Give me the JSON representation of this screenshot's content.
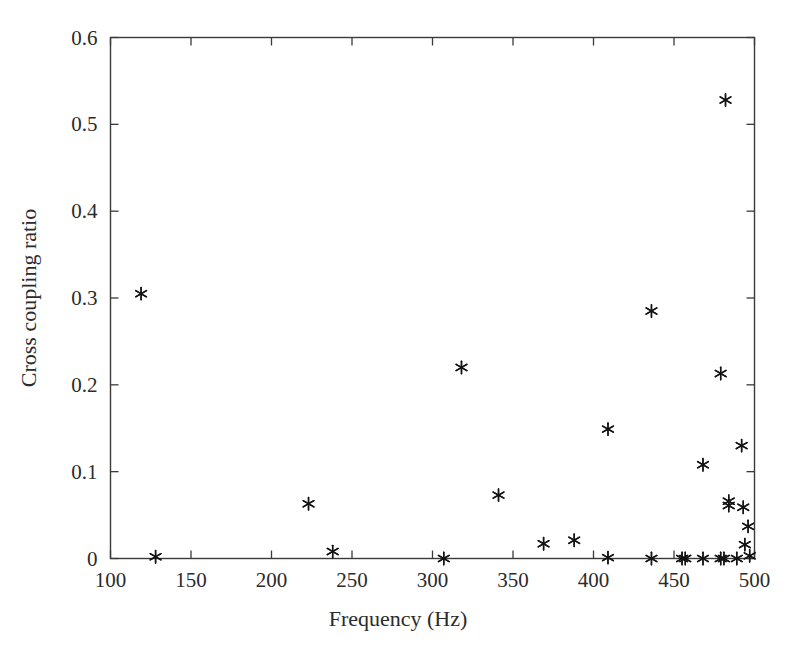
{
  "chart_data": {
    "type": "scatter",
    "title": "",
    "xlabel": "Frequency (Hz)",
    "ylabel": "Cross coupling ratio",
    "xlim": [
      100,
      500
    ],
    "ylim": [
      0,
      0.6
    ],
    "xticks": [
      100,
      150,
      200,
      250,
      300,
      350,
      400,
      450,
      500
    ],
    "xticklabels": [
      "100",
      "150",
      "200",
      "250",
      "300",
      "350",
      "400",
      "450",
      "500"
    ],
    "yticks": [
      0,
      0.1,
      0.2,
      0.3,
      0.4,
      0.5,
      0.6
    ],
    "yticklabels": [
      "0",
      "0.1",
      "0.2",
      "0.3",
      "0.4",
      "0.5",
      "0.6"
    ],
    "grid": false,
    "legend": null,
    "marker_style": "asterisk",
    "marker_color": "#141414",
    "series": [
      {
        "name": "Cross coupling ratio",
        "points": [
          [
            119,
            0.305
          ],
          [
            128,
            0.002
          ],
          [
            223,
            0.063
          ],
          [
            238,
            0.008
          ],
          [
            307,
            0.0
          ],
          [
            318,
            0.22
          ],
          [
            341,
            0.073
          ],
          [
            369,
            0.017
          ],
          [
            388,
            0.021
          ],
          [
            409,
            0.149
          ],
          [
            409,
            0.001
          ],
          [
            436,
            0.285
          ],
          [
            436,
            0.0
          ],
          [
            455,
            0.0
          ],
          [
            457,
            0.0
          ],
          [
            468,
            0.108
          ],
          [
            468,
            0.0
          ],
          [
            479,
            0.213
          ],
          [
            479,
            0.0
          ],
          [
            481,
            0.0
          ],
          [
            482,
            0.528
          ],
          [
            484,
            0.066
          ],
          [
            484,
            0.061
          ],
          [
            489,
            0.0
          ],
          [
            492,
            0.13
          ],
          [
            493,
            0.059
          ],
          [
            494,
            0.016
          ],
          [
            496,
            0.037
          ],
          [
            497,
            0.003
          ]
        ]
      }
    ]
  },
  "axes": {
    "x_label": "Frequency (Hz)",
    "y_label": "Cross coupling ratio"
  }
}
